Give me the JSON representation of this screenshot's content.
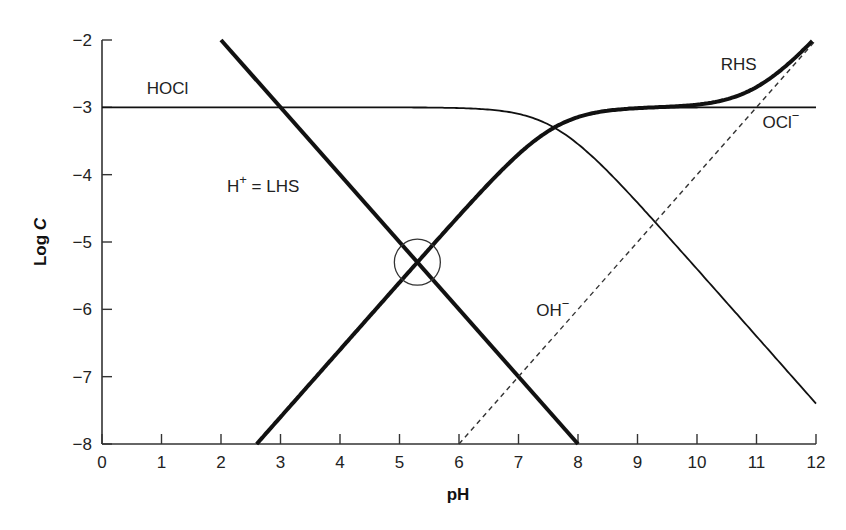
{
  "chart_data": {
    "type": "line",
    "title": "",
    "xlabel": "pH",
    "ylabel": "Log C",
    "xlim": [
      0,
      12
    ],
    "ylim": [
      -8,
      -2
    ],
    "xticks": [
      0,
      1,
      2,
      3,
      4,
      5,
      6,
      7,
      8,
      9,
      10,
      11,
      12
    ],
    "yticks": [
      -2,
      -3,
      -4,
      -5,
      -6,
      -7,
      -8
    ],
    "grid": false,
    "legend": "none (curves labeled inline)",
    "params": {
      "total_log_C": -3,
      "pKa": 7.6,
      "pKw": 14
    },
    "series": [
      {
        "name": "HOCl",
        "style": "thin-solid",
        "x": [
          0,
          2,
          4,
          5,
          6,
          7,
          7.6,
          8,
          9,
          10,
          11,
          12
        ],
        "y": [
          -3.0,
          -3.0,
          -3.0,
          -3.0,
          -3.01,
          -3.1,
          -3.3,
          -3.55,
          -4.42,
          -5.4,
          -6.4,
          -7.4
        ]
      },
      {
        "name": "OCl⁻",
        "style": "thin-solid",
        "x": [
          2.6,
          4,
          5,
          6,
          7,
          7.6,
          8,
          9,
          10,
          11,
          12
        ],
        "y": [
          -8.0,
          -6.6,
          -5.6,
          -4.61,
          -3.7,
          -3.3,
          -3.15,
          -3.02,
          -3.0,
          -3.0,
          -3.0
        ]
      },
      {
        "name": "H⁺ = LHS",
        "style": "thick-solid",
        "x": [
          2,
          8
        ],
        "y": [
          -2,
          -8
        ]
      },
      {
        "name": "OH⁻",
        "style": "dashed",
        "x": [
          6,
          12
        ],
        "y": [
          -8,
          -2
        ]
      },
      {
        "name": "RHS",
        "style": "thick-solid",
        "x": [
          2.6,
          4,
          5,
          6,
          7,
          7.6,
          8,
          9,
          10,
          10.5,
          11,
          11.5,
          12
        ],
        "y": [
          -8.0,
          -6.6,
          -5.6,
          -4.61,
          -3.7,
          -3.3,
          -3.15,
          -3.02,
          -2.96,
          -2.88,
          -2.7,
          -2.4,
          -2.0
        ]
      }
    ],
    "annotations": [
      {
        "text": "HOCl",
        "x": 0.75,
        "y": -2.8
      },
      {
        "text": "H⁺ = LHS",
        "x": 2.1,
        "y": -4.25
      },
      {
        "text": "RHS",
        "x": 10.4,
        "y": -2.45
      },
      {
        "text": "OCl⁻",
        "x": 11.1,
        "y": -3.3
      },
      {
        "text": "OH⁻",
        "x": 7.3,
        "y": -6.1
      }
    ],
    "marker_circle": {
      "x": 5.3,
      "y": -5.3,
      "radius_px": 23,
      "label": "proton condition solution (LHS = RHS)"
    }
  }
}
